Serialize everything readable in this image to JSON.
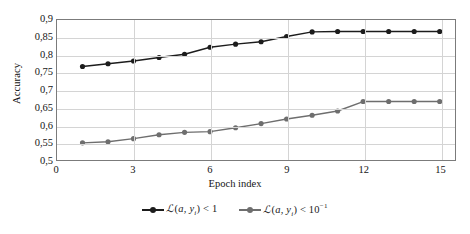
{
  "chart_data": {
    "type": "line",
    "title": "",
    "xlabel": "Epoch index",
    "ylabel": "Accuracy",
    "xlim": [
      0,
      15.6
    ],
    "ylim": [
      0.5,
      0.9
    ],
    "grid": true,
    "legend_position": "bottom",
    "x_ticks": [
      "0",
      "3",
      "6",
      "9",
      "12",
      "15"
    ],
    "x_tick_values": [
      0,
      3,
      6,
      9,
      12,
      15
    ],
    "y_ticks": [
      "0,5",
      "0,55",
      "0,6",
      "0,65",
      "0,7",
      "0,75",
      "0,8",
      "0,85",
      "0,9"
    ],
    "y_tick_values": [
      0.5,
      0.55,
      0.6,
      0.65,
      0.7,
      0.75,
      0.8,
      0.85,
      0.9
    ],
    "decimal_separator": ",",
    "x": [
      1,
      2,
      3,
      4,
      5,
      6,
      7,
      8,
      9,
      10,
      11,
      12,
      13,
      14,
      15
    ],
    "series": [
      {
        "name": "loss-lt-1",
        "legend_text": "ℒ(a, yᵢ) < 1",
        "color": "#1c1c1c",
        "marker": "circle",
        "values": [
          0.767,
          0.775,
          0.783,
          0.793,
          0.802,
          0.822,
          0.831,
          0.838,
          0.853,
          0.866,
          0.867,
          0.867,
          0.867,
          0.867,
          0.867
        ]
      },
      {
        "name": "loss-lt-10e-1",
        "legend_text": "ℒ(a, yᵢ) < 10⁻¹",
        "color": "#6e6e6e",
        "marker": "circle",
        "values": [
          0.549,
          0.552,
          0.561,
          0.572,
          0.579,
          0.581,
          0.592,
          0.604,
          0.617,
          0.628,
          0.64,
          0.667,
          0.667,
          0.667,
          0.667
        ]
      }
    ]
  },
  "legend": {
    "items": [
      {
        "prefix": "ℒ",
        "open": "(",
        "var_a": "a",
        "comma": ", ",
        "var_y": "y",
        "sub": "i",
        "close": ")",
        "op": " < ",
        "value": "1",
        "exponent": ""
      },
      {
        "prefix": "ℒ",
        "open": "(",
        "var_a": "a",
        "comma": ", ",
        "var_y": "y",
        "sub": "i",
        "close": ")",
        "op": " < ",
        "value": "10",
        "exponent": "−1"
      }
    ]
  },
  "axes": {
    "y_title": "Accuracy",
    "x_title": "Epoch index"
  },
  "colors": {
    "series_dark": "#1c1c1c",
    "series_gray": "#6e6e6e",
    "grid": "#d4d4d4",
    "frame": "#7b7b7b",
    "text": "#141414",
    "background": "#ffffff"
  }
}
